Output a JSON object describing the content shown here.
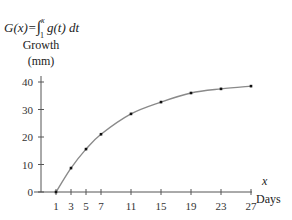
{
  "chart_data": {
    "type": "line",
    "formula": {
      "lhs": "G(x)",
      "equals": "=",
      "integral": "∫",
      "upper": "x",
      "lower": "1",
      "integrand": "g(t) dt"
    },
    "ylabel_line1": "Growth",
    "ylabel_line2": "(mm)",
    "xlabel_var": "x",
    "xlabel": "Days",
    "x_ticks": [
      1,
      3,
      5,
      7,
      11,
      15,
      19,
      23,
      27
    ],
    "y_ticks": [
      0,
      10,
      20,
      30,
      40
    ],
    "xlim": [
      0,
      30
    ],
    "ylim": [
      0,
      42
    ],
    "grid": false,
    "legend": null,
    "series": [
      {
        "name": "G(x)",
        "x": [
          1,
          3,
          5,
          7,
          11,
          15,
          19,
          23,
          27
        ],
        "values": [
          0,
          8.7,
          15.6,
          21,
          28.4,
          32.7,
          36,
          37.5,
          38.5
        ]
      }
    ],
    "colors": {
      "curve": "#8a8a8a",
      "points": "#111111",
      "axis": "#555555"
    }
  }
}
